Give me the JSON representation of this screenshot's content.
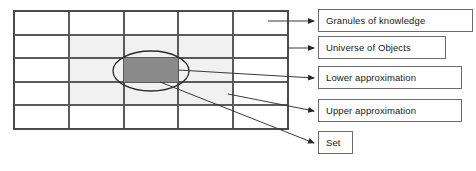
{
  "diagram": {
    "colors": {
      "grid_line": "#5a5a5a",
      "grid_border": "#4a4a4a",
      "upper_approximation_fill": "#f1f1f1",
      "set_fill": "#8a8a8a",
      "set_outline": "#2b2b2b",
      "leader_line": "#3a3a3a",
      "box_border": "#6b6b6b",
      "box_fill": "#ffffff",
      "text": "#1a1a1a"
    },
    "grid": {
      "columns": 5,
      "rows": 5,
      "left": 14,
      "top": 11,
      "right": 288,
      "bottom": 129,
      "column_x": [
        14,
        69,
        124,
        178,
        233,
        288
      ],
      "row_y": [
        11,
        35,
        58,
        82,
        105,
        129
      ]
    },
    "upper_approximation_region": {
      "x": 69,
      "y": 35,
      "width": 164,
      "height": 70
    },
    "set_ellipse": {
      "cx": 151,
      "cy": 71,
      "rx": 38,
      "ry": 20
    },
    "lower_approximation_cell": {
      "x": 124,
      "y": 58,
      "width": 54,
      "height": 24
    },
    "labels": [
      {
        "id": "granules-of-knowledge",
        "text": "Granules of knowledge",
        "leader": {
          "x1": 268,
          "y1": 21,
          "x2": 314,
          "y2": 21
        }
      },
      {
        "id": "universe-of-objects",
        "text": "Universe of Objects",
        "leader": {
          "x1": 288,
          "y1": 48,
          "x2": 314,
          "y2": 48
        }
      },
      {
        "id": "lower-approximation",
        "text": "Lower approximation",
        "leader": {
          "x1": 178,
          "y1": 70,
          "x2": 314,
          "y2": 78
        }
      },
      {
        "id": "upper-approximation",
        "text": "Upper approximation",
        "leader": {
          "x1": 228,
          "y1": 94,
          "x2": 314,
          "y2": 111
        }
      },
      {
        "id": "set",
        "text": "Set",
        "leader": {
          "x1": 160,
          "y1": 82,
          "x2": 314,
          "y2": 143
        }
      }
    ]
  }
}
